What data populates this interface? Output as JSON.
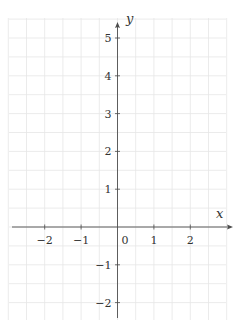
{
  "chart_data": {
    "type": "line",
    "title": "",
    "xlabel": "x",
    "ylabel": "y",
    "xlim": [
      -3,
      3
    ],
    "ylim": [
      -2.5,
      5.5
    ],
    "x_ticks": [
      -2,
      -1,
      0,
      1,
      2
    ],
    "x_tick_labels": [
      "−2",
      "−1",
      "0",
      "1",
      "2"
    ],
    "y_ticks": [
      5,
      4,
      3,
      2,
      1,
      -1,
      -2
    ],
    "y_tick_labels": [
      "5",
      "4",
      "3",
      "2",
      "1",
      "−1",
      "−2"
    ],
    "grid": true,
    "grid_step": 0.5,
    "series": [],
    "legend": null
  },
  "colors": {
    "grid": "#e6e6e6",
    "axis": "#4d4d4d",
    "text": "#333333",
    "background": "#ffffff"
  }
}
